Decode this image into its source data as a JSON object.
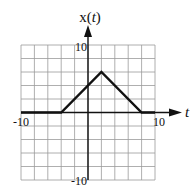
{
  "chart_data": {
    "type": "line",
    "title": "",
    "xlabel": "t",
    "ylabel_prefix": "x(",
    "ylabel_var": "t",
    "ylabel_suffix": ")",
    "xlim": [
      -10,
      10
    ],
    "ylim": [
      -10,
      10
    ],
    "grid": true,
    "grid_step": 2,
    "x_tick_labels": [
      {
        "value": -10,
        "label": "-10"
      },
      {
        "value": 10,
        "label": "10"
      }
    ],
    "y_tick_labels": [
      {
        "value": 10,
        "label": "10"
      },
      {
        "value": -10,
        "label": "-10"
      }
    ],
    "series": [
      {
        "name": "x(t)",
        "points": [
          [
            -10,
            0
          ],
          [
            -4,
            0
          ],
          [
            2,
            6
          ],
          [
            8,
            0
          ],
          [
            10,
            0
          ]
        ]
      }
    ],
    "colors": {
      "line": "#111111",
      "grid": "#9a9a9a"
    }
  }
}
